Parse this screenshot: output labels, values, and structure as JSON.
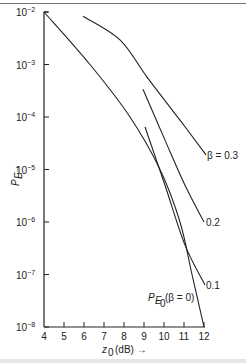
{
  "chart_data": {
    "type": "line",
    "title": "",
    "xlabel": "z0 (dB) →",
    "ylabel": "P_E →",
    "x_ticks": [
      4,
      5,
      6,
      7,
      8,
      9,
      10,
      11,
      12
    ],
    "y_ticks": [
      "10^-2",
      "10^-3",
      "10^-4",
      "10^-5",
      "10^-6",
      "10^-7",
      "10^-8"
    ],
    "y_scale": "log",
    "xlim": [
      4,
      12
    ],
    "ylim": [
      1e-08,
      0.01
    ],
    "grid": false,
    "legend": "inline curve labels",
    "series": [
      {
        "name": "P_E0 (β = 0)",
        "label": "P_E0(β = 0)",
        "x": [
          4.0,
          6.3,
          8.3,
          9.8,
          10.8,
          11.4,
          12.0
        ],
        "log10_y": [
          -2.0,
          -3.0,
          -4.0,
          -5.0,
          -6.0,
          -7.0,
          -8.0
        ]
      },
      {
        "name": "β = 0.1",
        "label": "0.1",
        "x": [
          9.05,
          10.05,
          11.05,
          12.05
        ],
        "log10_y": [
          -4.19,
          -5.3,
          -6.44,
          -7.2
        ]
      },
      {
        "name": "β = 0.2",
        "label": "0.2",
        "x": [
          8.95,
          10.05,
          11.05,
          12.0
        ],
        "log10_y": [
          -3.47,
          -4.44,
          -5.3,
          -6.0
        ]
      },
      {
        "name": "β = 0.3",
        "label": "β = 0.3",
        "x": [
          5.95,
          7.8,
          9.15,
          10.8,
          12.1
        ],
        "log10_y": [
          -2.08,
          -2.53,
          -3.24,
          -4.06,
          -4.72
        ]
      }
    ]
  },
  "labels": {
    "x_axis": "(dB) →",
    "x_axis_var": "z",
    "x_axis_sub": "0",
    "y_axis_var": "P",
    "y_axis_sub": "E",
    "y_axis_arrow": "→",
    "y_tick_base": "10",
    "y_tick_exps": [
      "−2",
      "−3",
      "−4",
      "−5",
      "−6",
      "−7",
      "−8"
    ],
    "x_ticks": [
      "4",
      "5",
      "6",
      "7",
      "8",
      "9",
      "10",
      "11",
      "12"
    ],
    "curve_b0_main": "P",
    "curve_b0_sub": "E",
    "curve_b0_subsub": "0",
    "curve_b0_rest": "(β = 0)",
    "curve_b01": "0.1",
    "curve_b02": "0.2",
    "curve_b03": "β = 0.3"
  }
}
